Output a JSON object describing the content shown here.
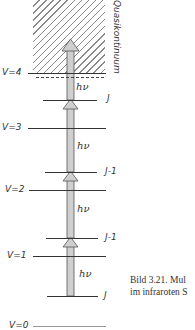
{
  "diagram": {
    "region_label": "Quasikontinuum",
    "vibrational_levels": [
      {
        "label": "V=4",
        "y": 73
      },
      {
        "label": "V=3",
        "y": 128
      },
      {
        "label": "V=2",
        "y": 190
      },
      {
        "label": "V=1",
        "y": 256
      },
      {
        "label": "V=0",
        "y": 325
      }
    ],
    "rotational_levels": [
      {
        "label": "J",
        "y": 100
      },
      {
        "label": "J-1",
        "y": 172
      },
      {
        "label": "J-1",
        "y": 238
      },
      {
        "label": "J",
        "y": 296
      }
    ],
    "photon_labels": [
      "hν",
      "hν",
      "hν",
      "hν"
    ],
    "caption": {
      "line1": "Bild 3.21.  Mul",
      "line2": "im infraroten S"
    }
  }
}
